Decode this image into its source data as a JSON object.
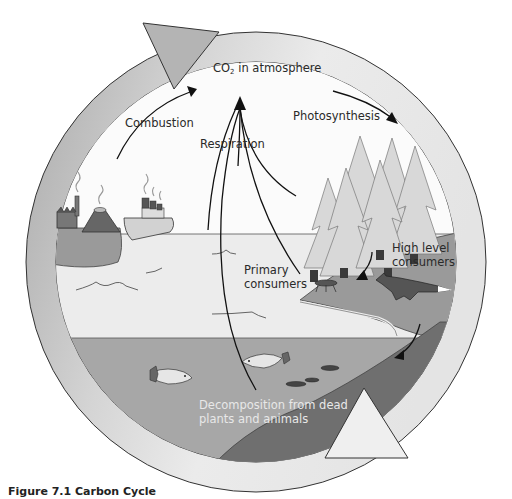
{
  "figure": {
    "caption": "Figure 7.1 Carbon Cycle",
    "title": "Carbon Cycle"
  },
  "labels": {
    "co2_prefix": "CO",
    "co2_sub": "2",
    "co2_suffix": " in atmosphere",
    "combustion": "Combustion",
    "photosynthesis": "Photosynthesis",
    "respiration": "Respiration",
    "primary_consumers_line1": "Primary",
    "primary_consumers_line2": "consumers",
    "high_level_consumers_line1": "High level",
    "high_level_consumers_line2": "consumers",
    "decomposition_line1": "Decomposition from dead",
    "decomposition_line2": "plants and animals"
  },
  "elements": {
    "sources": [
      "factory",
      "volcano",
      "ship"
    ],
    "organisms": [
      "trees",
      "primary consumer (insect)",
      "fox",
      "fish",
      "fish"
    ],
    "cycle_arrows": [
      "top-left arrowhead",
      "bottom-right arrowhead"
    ]
  },
  "colors": {
    "ring_light": "#e6e6e6",
    "ring_dark": "#a9a9a9",
    "sky": "#fbfbfb",
    "sea_surface": "#ececec",
    "sea_deep": "#a7a7a7",
    "land": "#9a9a9a",
    "seabed": "#6f6f6f",
    "trees": "#d9d9d9",
    "outline": "#333333"
  }
}
